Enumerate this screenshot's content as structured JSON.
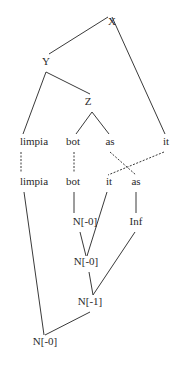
{
  "diagram": {
    "type": "tree-derivation",
    "nodes": [
      {
        "id": "X",
        "label": "X",
        "x": 112,
        "y": 25
      },
      {
        "id": "Y",
        "label": "Y",
        "x": 46,
        "y": 65
      },
      {
        "id": "Z",
        "label": "Z",
        "x": 88,
        "y": 105
      },
      {
        "id": "limpia1",
        "label": "limpia",
        "x": 34,
        "y": 145
      },
      {
        "id": "bot1",
        "label": "bot",
        "x": 73,
        "y": 145
      },
      {
        "id": "as1",
        "label": "as",
        "x": 110,
        "y": 145
      },
      {
        "id": "it1",
        "label": "it",
        "x": 166,
        "y": 145
      },
      {
        "id": "limpia2",
        "label": "limpia",
        "x": 34,
        "y": 185
      },
      {
        "id": "bot2",
        "label": "bot",
        "x": 73,
        "y": 185
      },
      {
        "id": "it2",
        "label": "it",
        "x": 109,
        "y": 185
      },
      {
        "id": "as2",
        "label": "as",
        "x": 136,
        "y": 185
      },
      {
        "id": "n0a",
        "label": "N[-0]",
        "x": 85,
        "y": 225
      },
      {
        "id": "inf",
        "label": "Inf",
        "x": 136,
        "y": 225
      },
      {
        "id": "n0b",
        "label": "N[-0]",
        "x": 86,
        "y": 265
      },
      {
        "id": "n1",
        "label": "N[-1]",
        "x": 90,
        "y": 305
      },
      {
        "id": "n0c",
        "label": "N[-0]",
        "x": 45,
        "y": 345
      }
    ],
    "edges": [
      {
        "from": [
          108,
          17
        ],
        "to": [
          49,
          54
        ],
        "style": "solid"
      },
      {
        "from": [
          112,
          17
        ],
        "to": [
          165,
          134
        ],
        "style": "solid"
      },
      {
        "from": [
          46,
          72
        ],
        "to": [
          90,
          94
        ],
        "style": "solid"
      },
      {
        "from": [
          46,
          72
        ],
        "to": [
          23,
          134
        ],
        "style": "solid"
      },
      {
        "from": [
          92,
          112
        ],
        "to": [
          76,
          134
        ],
        "style": "solid"
      },
      {
        "from": [
          92,
          112
        ],
        "to": [
          109,
          134
        ],
        "style": "solid"
      },
      {
        "from": [
          21,
          152
        ],
        "to": [
          21,
          172
        ],
        "style": "dashed"
      },
      {
        "from": [
          74,
          152
        ],
        "to": [
          74,
          172
        ],
        "style": "dashed"
      },
      {
        "from": [
          110,
          152
        ],
        "to": [
          136,
          175
        ],
        "style": "dashed"
      },
      {
        "from": [
          164,
          152
        ],
        "to": [
          108,
          175
        ],
        "style": "dashed"
      },
      {
        "from": [
          24,
          192
        ],
        "to": [
          44,
          335
        ],
        "style": "solid"
      },
      {
        "from": [
          74,
          192
        ],
        "to": [
          74,
          213
        ],
        "style": "solid"
      },
      {
        "from": [
          107,
          192
        ],
        "to": [
          87,
          256
        ],
        "style": "solid"
      },
      {
        "from": [
          136,
          192
        ],
        "to": [
          136,
          213
        ],
        "style": "solid"
      },
      {
        "from": [
          80,
          232
        ],
        "to": [
          86,
          256
        ],
        "style": "solid"
      },
      {
        "from": [
          135,
          232
        ],
        "to": [
          93,
          295
        ],
        "style": "solid"
      },
      {
        "from": [
          89,
          272
        ],
        "to": [
          93,
          295
        ],
        "style": "solid"
      },
      {
        "from": [
          90,
          312
        ],
        "to": [
          45,
          335
        ],
        "style": "solid"
      }
    ]
  }
}
